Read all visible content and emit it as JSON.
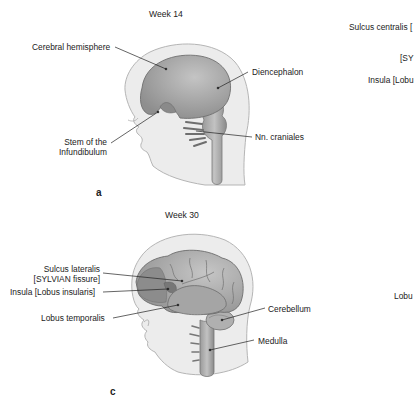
{
  "figure": {
    "panels": [
      {
        "id": "a",
        "letter": "a",
        "title": "Week 14",
        "labels": {
          "cerebral_hemisphere": "Cerebral hemisphere",
          "diencephalon": "Diencephalon",
          "stem_line1": "Stem of the",
          "stem_line2": "Infundibulum",
          "nn_craniales": "Nn. craniales"
        }
      },
      {
        "id": "c",
        "letter": "c",
        "title": "Week 30",
        "labels": {
          "sulcus_lateralis_line1": "Sulcus lateralis",
          "sulcus_lateralis_line2": "[SYLVIAN fissure]",
          "insula": "Insula [Lobus insularis]",
          "lobus_temporalis": "Lobus temporalis",
          "cerebellum": "Cerebellum",
          "medulla": "Medulla"
        }
      }
    ],
    "cropped_right_labels": {
      "sulcus_centralis": "Sulcus centralis [",
      "sylvian_partial": "[SY",
      "insula_partial": "Insula [Lobu",
      "lobus_partial": "Lobu"
    },
    "colors": {
      "head_fill": "#ececec",
      "head_outline": "#b8b8b8",
      "brain_fill": "#9a9a9a",
      "brain_light": "#bdbdbd",
      "brain_dark": "#7d7d7d",
      "leader_line": "#222222"
    }
  }
}
